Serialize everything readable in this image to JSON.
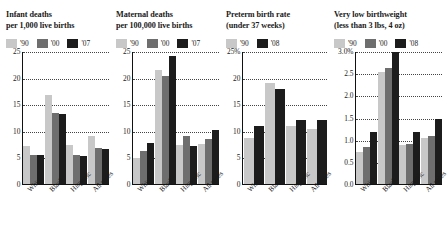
{
  "chart_data": [
    {
      "type": "bar",
      "title": "Infant deaths\nper 1,000 live births",
      "xlabel": "",
      "ylabel": "",
      "categories": [
        "White",
        "Black",
        "Hispanic",
        "All races"
      ],
      "series": [
        {
          "name": "'90",
          "color": "#c8c8c8",
          "values": [
            7.3,
            17.0,
            7.5,
            9.2
          ]
        },
        {
          "name": "'00",
          "color": "#6e6e6e",
          "values": [
            5.7,
            13.6,
            5.6,
            6.9
          ]
        },
        {
          "name": "'07",
          "color": "#1c1c1c",
          "values": [
            5.6,
            13.3,
            5.5,
            6.8
          ]
        }
      ],
      "yticks": [
        "0",
        "5",
        "10",
        "15",
        "20",
        "25"
      ],
      "ytickvalues": [
        0,
        5,
        10,
        15,
        20,
        25
      ],
      "ylim": [
        0,
        25
      ],
      "grid": true,
      "legend_position": "top"
    },
    {
      "type": "bar",
      "title": "Maternal deaths\nper 100,000 live births",
      "xlabel": "",
      "ylabel": "",
      "categories": [
        "White",
        "Black",
        "Hispanic",
        "All races"
      ],
      "series": [
        {
          "name": "'90",
          "color": "#c8c8c8",
          "values": [
            5.1,
            21.7,
            7.5,
            7.7
          ]
        },
        {
          "name": "'00",
          "color": "#6e6e6e",
          "values": [
            6.4,
            20.4,
            9.3,
            8.6
          ]
        },
        {
          "name": "'07",
          "color": "#1c1c1c",
          "values": [
            7.9,
            24.2,
            7.4,
            10.3
          ]
        }
      ],
      "yticks": [
        "0",
        "5",
        "10",
        "15",
        "20",
        "25"
      ],
      "ytickvalues": [
        0,
        5,
        10,
        15,
        20,
        25
      ],
      "ylim": [
        0,
        25
      ],
      "grid": true,
      "legend_position": "top"
    },
    {
      "type": "bar",
      "title": "Preterm birth rate\n(under 37 weeks)",
      "xlabel": "",
      "ylabel": "",
      "categories": [
        "White",
        "Black",
        "Hispanic",
        "All races"
      ],
      "series": [
        {
          "name": "'90",
          "color": "#c8c8c8",
          "values": [
            8.8,
            19.1,
            11.1,
            10.6
          ]
        },
        {
          "name": "'08",
          "color": "#1c1c1c",
          "values": [
            11.1,
            18.0,
            12.2,
            12.3
          ]
        }
      ],
      "yticks": [
        "0",
        "5",
        "10",
        "15",
        "20",
        "25%"
      ],
      "ytickvalues": [
        0,
        5,
        10,
        15,
        20,
        25
      ],
      "ylim": [
        0,
        25
      ],
      "grid": true,
      "legend_position": "top"
    },
    {
      "type": "bar",
      "title": "Very low birthweight\n(less than 3 lbs, 4 oz)",
      "xlabel": "",
      "ylabel": "",
      "categories": [
        "White",
        "Black",
        "Hispanic",
        "All races"
      ],
      "series": [
        {
          "name": "'90",
          "color": "#c8c8c8",
          "values": [
            0.75,
            2.55,
            0.9,
            1.05
          ]
        },
        {
          "name": "'00",
          "color": "#6e6e6e",
          "values": [
            0.85,
            2.65,
            0.93,
            1.1
          ]
        },
        {
          "name": "'08",
          "color": "#1c1c1c",
          "values": [
            1.2,
            3.0,
            1.2,
            1.5
          ]
        }
      ],
      "yticks": [
        "0.0",
        "0.5",
        "1.0",
        "1.5",
        "2.0",
        "2.5",
        "3.0%"
      ],
      "ytickvalues": [
        0,
        0.5,
        1.0,
        1.5,
        2.0,
        2.5,
        3.0
      ],
      "ylim": [
        0,
        3.0
      ],
      "grid": true,
      "legend_position": "top"
    }
  ]
}
